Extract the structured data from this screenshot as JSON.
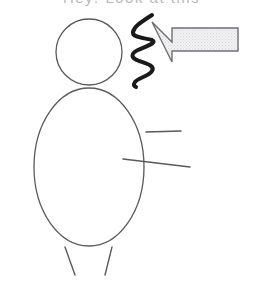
{
  "canvas": {
    "width": 263,
    "height": 288,
    "background_color": "#ffffff"
  },
  "title_strip": {
    "text": "Hey! Look at this",
    "note": "clipped at top edge of image, only bottom pixel rows visible",
    "color": "#b9b9bb"
  },
  "colors": {
    "outline": "#5a5a5e",
    "squiggle": "#1a1a1a",
    "arrow_border": "#707074",
    "arrow_fill": "#e8e8ea",
    "background": "#ffffff"
  },
  "figure": {
    "label": "stick-figure-person",
    "head": {
      "cx": 89,
      "cy": 52,
      "r": 33
    },
    "body": {
      "cx": 89,
      "cy": 167,
      "rx": 55,
      "ry": 79
    },
    "arm_upper": {
      "x1": 146,
      "y1": 132,
      "x2": 181,
      "y2": 131
    },
    "arm_lower": {
      "x1": 123,
      "y1": 159,
      "x2": 190,
      "y2": 167
    },
    "leg_left": {
      "x1": 65,
      "y1": 247,
      "x2": 75,
      "y2": 275
    },
    "leg_right": {
      "x1": 112,
      "y1": 247,
      "x2": 105,
      "y2": 275
    }
  },
  "arrow": {
    "label": "left-pointing-arrow",
    "direction": "left",
    "tip": {
      "x": 152,
      "y": 22
    },
    "shaft": {
      "x": 172,
      "y": 28,
      "width": 66,
      "height": 24
    },
    "points": "152,22 172,42 172,28 238,28 238,51 172,51 172,62 152,22"
  },
  "squiggle": {
    "label": "scribble-zigzag",
    "stroke_width": 4,
    "x_range": [
      130,
      156
    ],
    "y_range": [
      14,
      87
    ],
    "path": "M152,15 C138,24 134,27 133,32 C132,38 146,38 152,40 C158,43 146,46 138,50 C130,54 131,58 139,61 C148,64 155,66 152,71 C149,76 138,78 135,82 C133,85 134,86 136,87"
  }
}
